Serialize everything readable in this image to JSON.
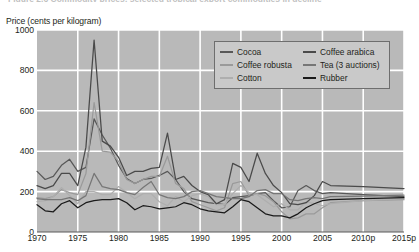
{
  "figure": {
    "title_clipped": "Figure 2.6  Commodity prices: selected tropical export commodities in decline",
    "axis_title": "Price (cents per kilogram)",
    "background_plot": "#b9b9b9",
    "gridline_color": "#ffffff",
    "legend_background": "#c9c9c9",
    "legend_border": "#6e6e6e"
  },
  "chart_data": {
    "type": "line",
    "title": "Figure 2.6  Commodity prices: selected tropical export commodities in decline",
    "xlabel": "",
    "ylabel": "Price (cents per kilogram)",
    "xlim": [
      1970,
      2015
    ],
    "ylim": [
      0,
      1000
    ],
    "ytick_labels": [
      "0",
      "200",
      "400",
      "600",
      "800",
      "1000"
    ],
    "ytick_values": [
      0,
      200,
      400,
      600,
      800,
      1000
    ],
    "xtick_labels": [
      "1970",
      "1975",
      "1980",
      "1985",
      "1990",
      "1995",
      "2000",
      "2005",
      "2010p",
      "2015p"
    ],
    "xtick_values": [
      1970,
      1975,
      1980,
      1985,
      1990,
      1995,
      2000,
      2005,
      2010,
      2015
    ],
    "grid": true,
    "legend_position": "top-right-inside",
    "projection_note": "p = projected",
    "x": [
      1970,
      1971,
      1972,
      1973,
      1974,
      1975,
      1976,
      1977,
      1978,
      1979,
      1980,
      1981,
      1982,
      1983,
      1984,
      1985,
      1986,
      1987,
      1988,
      1989,
      1990,
      1991,
      1992,
      1993,
      1994,
      1995,
      1996,
      1997,
      1998,
      1999,
      2000,
      2001,
      2002,
      2003,
      2004,
      2005,
      2006,
      2010,
      2015
    ],
    "series": [
      {
        "name": "Cocoa",
        "color": "#585858",
        "values": [
          300,
          260,
          275,
          330,
          360,
          300,
          320,
          560,
          480,
          415,
          330,
          265,
          240,
          260,
          265,
          280,
          300,
          260,
          200,
          165,
          155,
          145,
          140,
          135,
          170,
          175,
          180,
          190,
          195,
          155,
          120,
          125,
          205,
          230,
          205,
          190,
          195,
          185,
          175
        ]
      },
      {
        "name": "Coffee robusta",
        "color": "#9a9a9a",
        "values": [
          170,
          165,
          175,
          210,
          195,
          185,
          290,
          640,
          400,
          395,
          350,
          260,
          240,
          260,
          275,
          275,
          375,
          240,
          215,
          150,
          135,
          120,
          105,
          120,
          240,
          250,
          180,
          190,
          180,
          150,
          100,
          65,
          70,
          90,
          90,
          120,
          145,
          155,
          160
        ]
      },
      {
        "name": "Cotton",
        "color": "#aeaeae",
        "values": [
          150,
          155,
          175,
          220,
          180,
          140,
          200,
          200,
          185,
          185,
          225,
          195,
          165,
          190,
          190,
          150,
          130,
          175,
          150,
          180,
          190,
          175,
          135,
          135,
          190,
          230,
          195,
          185,
          155,
          125,
          140,
          110,
          110,
          150,
          140,
          130,
          140,
          155,
          165
        ]
      },
      {
        "name": "Coffee arabica",
        "color": "#4a4a4a",
        "values": [
          230,
          215,
          230,
          290,
          290,
          230,
          420,
          950,
          450,
          425,
          370,
          280,
          300,
          300,
          315,
          320,
          490,
          260,
          275,
          230,
          200,
          185,
          140,
          160,
          340,
          320,
          250,
          390,
          290,
          230,
          195,
          140,
          135,
          145,
          180,
          250,
          230,
          225,
          215
        ]
      },
      {
        "name": "Tea (3 auctions)",
        "color": "#767676",
        "values": [
          165,
          160,
          160,
          160,
          170,
          155,
          180,
          290,
          225,
          215,
          210,
          195,
          185,
          220,
          250,
          185,
          170,
          165,
          175,
          200,
          205,
          190,
          175,
          170,
          165,
          165,
          175,
          205,
          210,
          190,
          190,
          160,
          155,
          165,
          170,
          165,
          175,
          178,
          182
        ]
      },
      {
        "name": "Rubber",
        "color": "#1a1a1a",
        "values": [
          135,
          105,
          100,
          140,
          155,
          120,
          145,
          155,
          160,
          160,
          165,
          145,
          110,
          130,
          125,
          115,
          120,
          125,
          145,
          135,
          115,
          105,
          100,
          95,
          125,
          160,
          150,
          120,
          90,
          80,
          80,
          70,
          90,
          120,
          140,
          155,
          160,
          165,
          170
        ]
      }
    ]
  },
  "legend": {
    "left_column": [
      {
        "label": "Cocoa",
        "color": "#585858"
      },
      {
        "label": "Coffee robusta",
        "color": "#9a9a9a"
      },
      {
        "label": "Cotton",
        "color": "#aeaeae"
      }
    ],
    "right_column": [
      {
        "label": "Coffee arabica",
        "color": "#4a4a4a"
      },
      {
        "label": "Tea (3 auctions)",
        "color": "#767676"
      },
      {
        "label": "Rubber",
        "color": "#1a1a1a"
      }
    ]
  }
}
